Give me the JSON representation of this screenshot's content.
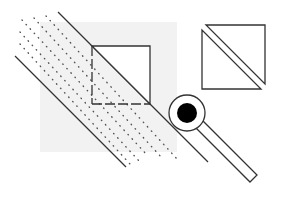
{
  "diagram": {
    "title": "",
    "background_color": "#ffffff",
    "stroke_color": "#333333",
    "fill_grey": "#f2f2f2",
    "dot_color": "#555555",
    "inner_circle_color": "#000000",
    "shapes": {
      "grey_square": {
        "x": 40,
        "y": 22,
        "w": 137,
        "h": 130
      },
      "upper_line": {
        "x1": 58,
        "y1": 12,
        "x2": 208,
        "y2": 162
      },
      "lower_line": {
        "x1": 15,
        "y1": 56,
        "x2": 125,
        "y2": 166
      },
      "dotted_lines": [
        {
          "x1": 22,
          "y1": 18,
          "x2": 150,
          "y2": 158
        },
        {
          "x1": 22,
          "y1": 30,
          "x2": 150,
          "y2": 166
        },
        {
          "x1": 20,
          "y1": 42,
          "x2": 140,
          "y2": 168
        },
        {
          "x1": 34,
          "y1": 16,
          "x2": 165,
          "y2": 158
        },
        {
          "x1": 46,
          "y1": 14,
          "x2": 180,
          "y2": 160
        }
      ],
      "small_square": {
        "x": 92,
        "y": 46,
        "w": 58,
        "h": 58
      },
      "ring": {
        "cx": 187,
        "cy": 113,
        "r": 18
      },
      "dot": {
        "cx": 187,
        "cy": 113,
        "r": 10
      },
      "bar": {
        "points": "196,128 250,182 257,175 203,121"
      },
      "split_square": {
        "x": 202,
        "y": 25,
        "w": 63,
        "h": 64
      }
    }
  }
}
